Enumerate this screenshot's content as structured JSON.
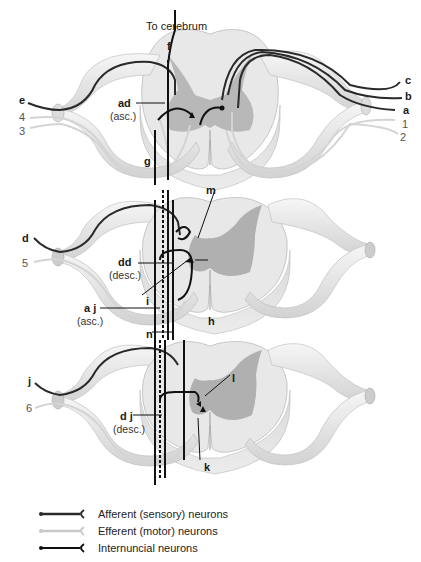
{
  "title_label": "To cerebrum",
  "segments": [
    {
      "name": "upper",
      "nerve_labels_right": [
        "c",
        "b",
        "a",
        "1",
        "2"
      ],
      "nerve_labels_left": [
        "e",
        "4",
        "3"
      ]
    },
    {
      "name": "middle",
      "nerve_labels_left": [
        "d",
        "5"
      ]
    },
    {
      "name": "lower",
      "nerve_labels_left": [
        "j",
        "6"
      ]
    }
  ],
  "labels": {
    "f": "f",
    "ad": "ad",
    "ad_sub": "(asc.)",
    "g": "g",
    "m": "m",
    "dd": "dd",
    "dd_sub": "(desc.)",
    "i": "i",
    "aj": "a j",
    "aj_sub": "(asc.)",
    "h": "h",
    "n": "n",
    "l": "l",
    "dj": "d j",
    "dj_sub": "(desc.)",
    "k": "k",
    "c": "c",
    "b": "b",
    "a": "a",
    "one": "1",
    "two": "2",
    "e": "e",
    "four": "4",
    "three": "3",
    "d": "d",
    "five": "5",
    "j": "j",
    "six": "6"
  },
  "legend": [
    {
      "label": "Afferent (sensory) neurons",
      "color": "#2a2a2a",
      "type": "afferent"
    },
    {
      "label": "Efferent (motor) neurons",
      "color": "#c8c8c8",
      "type": "efferent"
    },
    {
      "label": "Internuncial neurons",
      "color": "#111111",
      "type": "internuncial"
    }
  ],
  "colors": {
    "cord_white_matter": "#e6e6e6",
    "cord_gray_matter": "#b4b4b4",
    "nerve_sheath": "#eeeeee",
    "afferent": "#2a2a2a",
    "efferent": "#d0d0d0",
    "internuncial": "#111111"
  }
}
